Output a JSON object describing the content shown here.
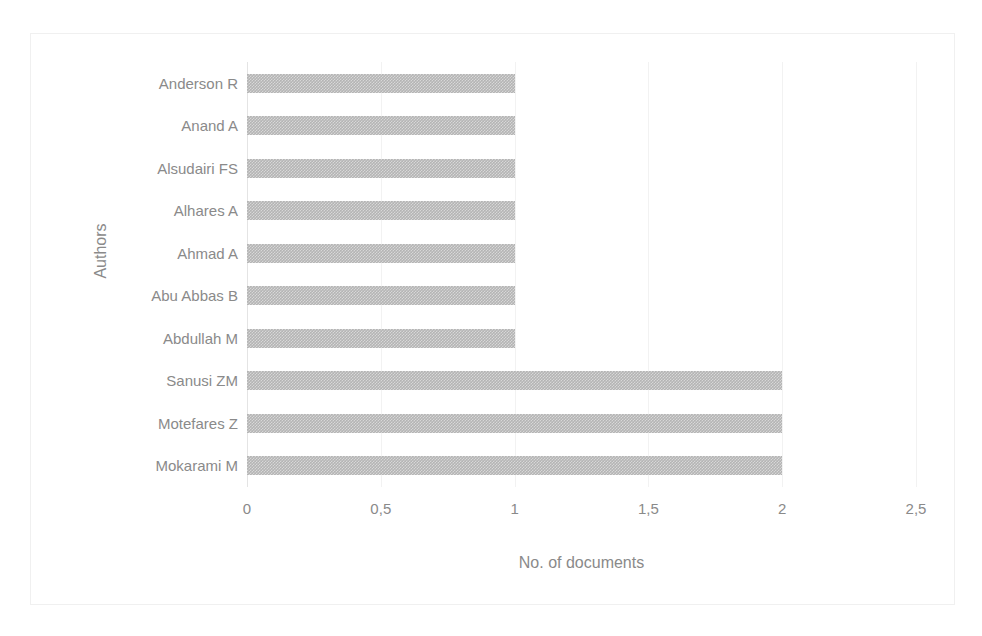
{
  "chart_data": {
    "type": "bar",
    "orientation": "horizontal",
    "title": "",
    "xlabel": "No. of documents",
    "ylabel": "Authors",
    "categories": [
      "Anderson R",
      "Anand A",
      "Alsudairi FS",
      "Alhares A",
      "Ahmad A",
      "Abu Abbas B",
      "Abdullah M",
      "Sanusi ZM",
      "Motefares Z",
      "Mokarami M"
    ],
    "values": [
      1,
      1,
      1,
      1,
      1,
      1,
      1,
      2,
      2,
      2
    ],
    "xlim": [
      0,
      2.5
    ],
    "xticks": [
      0,
      0.5,
      1,
      1.5,
      2,
      2.5
    ],
    "xtick_labels": [
      "0",
      "0,5",
      "1",
      "1,5",
      "2",
      "2,5"
    ],
    "grid": true,
    "grid_axis": "x",
    "legend": false,
    "bar_color": "#b4b4b4",
    "text_color": "#8a8a8a",
    "gridline_color": "#f2f2f2",
    "border_color": "#f0f0f0",
    "background_color": "#ffffff"
  }
}
